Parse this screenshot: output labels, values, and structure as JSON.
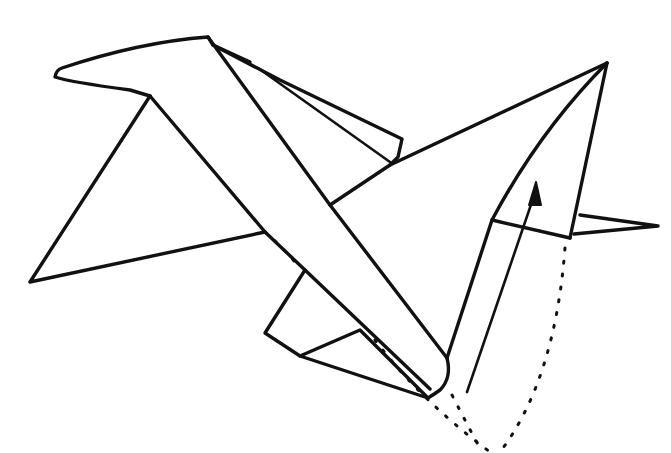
{
  "diagram": {
    "title": "",
    "type": "origami fold diagram",
    "colors": {
      "line": "#111111",
      "background": "#ffffff"
    },
    "elements": [
      {
        "name": "upper-left-wing-flap",
        "style": "solid"
      },
      {
        "name": "left-triangle-wing",
        "style": "solid"
      },
      {
        "name": "diagonal-band",
        "style": "solid"
      },
      {
        "name": "back-flap",
        "style": "solid"
      },
      {
        "name": "right-triangle-body",
        "style": "solid"
      },
      {
        "name": "lower-flap",
        "style": "solid"
      },
      {
        "name": "tail-point",
        "style": "solid"
      },
      {
        "name": "hidden-edge",
        "style": "dotted"
      },
      {
        "name": "fold-guide-left",
        "style": "dotted"
      },
      {
        "name": "fold-guide-middle",
        "style": "dotted"
      },
      {
        "name": "fold-guide-right",
        "style": "dotted"
      },
      {
        "name": "push-up-arrow",
        "style": "arrow"
      }
    ]
  }
}
